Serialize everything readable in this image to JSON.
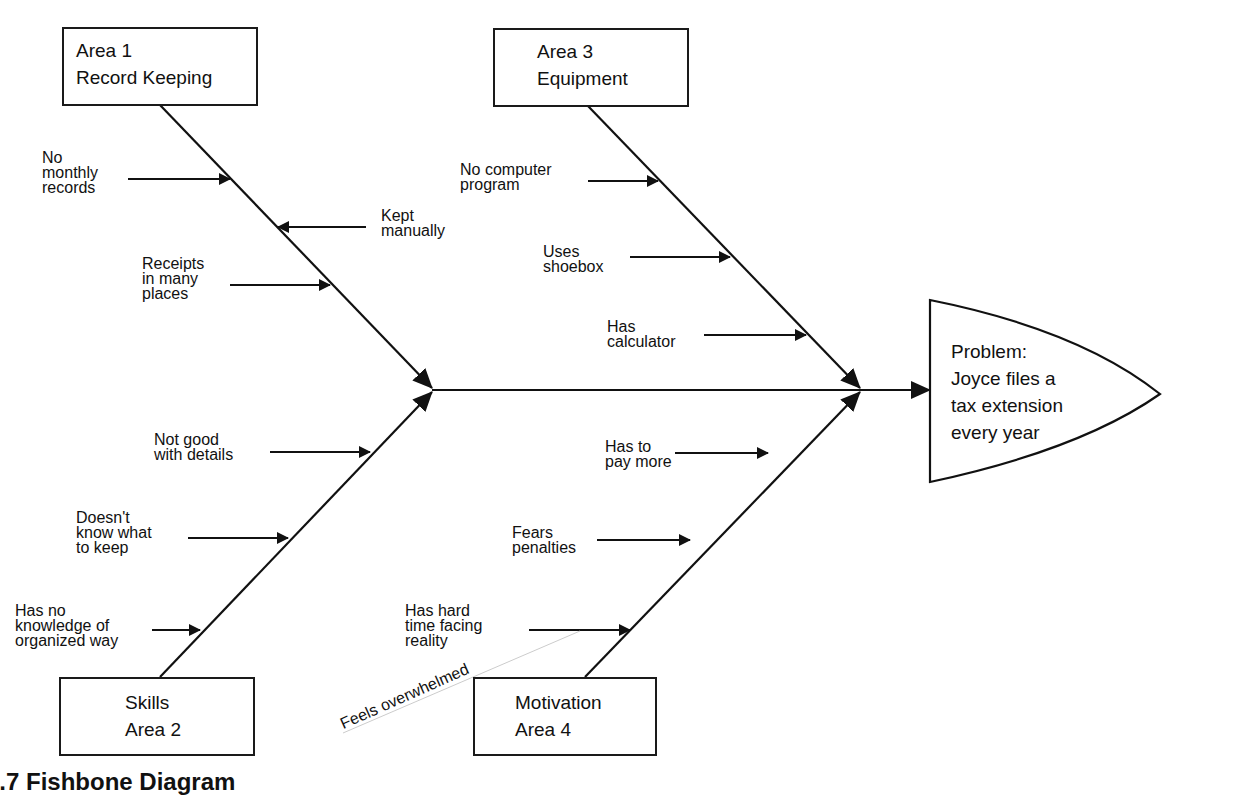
{
  "figure": {
    "caption": "1.7 Fishbone Diagram"
  },
  "problem": {
    "lines": [
      "Problem:",
      "Joyce files a",
      "tax extension",
      "every year"
    ]
  },
  "areas": [
    {
      "id": "area1",
      "lines": [
        "Area 1",
        "Record Keeping"
      ],
      "causes": [
        {
          "lines": [
            "No",
            "monthly",
            "records"
          ]
        },
        {
          "lines": [
            "Kept",
            "manually"
          ]
        },
        {
          "lines": [
            "Receipts",
            "in many",
            "places"
          ]
        }
      ]
    },
    {
      "id": "area2",
      "lines": [
        "Skills",
        "Area 2"
      ],
      "causes": [
        {
          "lines": [
            "Not good",
            "with details"
          ]
        },
        {
          "lines": [
            "Doesn't",
            "know what",
            "to keep"
          ]
        },
        {
          "lines": [
            "Has no",
            "knowledge of",
            "organized way"
          ]
        }
      ]
    },
    {
      "id": "area3",
      "lines": [
        "Area 3",
        "Equipment"
      ],
      "causes": [
        {
          "lines": [
            "No computer",
            "program"
          ]
        },
        {
          "lines": [
            "Uses",
            "shoebox"
          ]
        },
        {
          "lines": [
            "Has",
            "calculator"
          ]
        }
      ]
    },
    {
      "id": "area4",
      "lines": [
        "Motivation",
        "Area 4"
      ],
      "causes": [
        {
          "lines": [
            "Has to",
            "pay more"
          ]
        },
        {
          "lines": [
            "Fears",
            "penalties"
          ]
        },
        {
          "lines": [
            "Has hard",
            "time facing",
            "reality"
          ]
        }
      ],
      "annotation": "Feels overwhelmed"
    }
  ]
}
